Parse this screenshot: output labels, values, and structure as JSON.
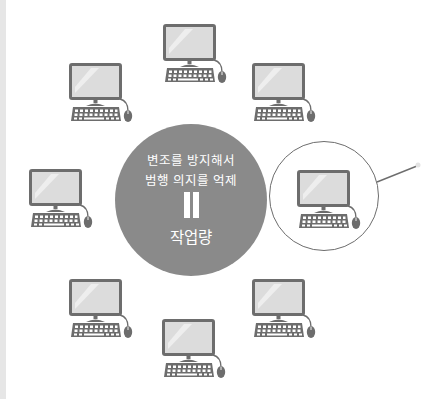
{
  "center": {
    "line1": "변조를 방지해서",
    "line2": "범행 의지를 억제",
    "equals_symbol": "‖",
    "result": "작업량"
  },
  "colors": {
    "circle_fill": "#8a8a8a",
    "icon_stroke": "#6d6d6d",
    "screen_fill": "#dcdcdc",
    "left_bar": "#e6e6e6"
  },
  "computers": [
    {
      "position": "top",
      "icon": "desktop-computer-icon"
    },
    {
      "position": "top-left",
      "icon": "desktop-computer-icon"
    },
    {
      "position": "top-right",
      "icon": "desktop-computer-icon"
    },
    {
      "position": "left",
      "icon": "desktop-computer-icon"
    },
    {
      "position": "right-highlighted",
      "icon": "desktop-computer-icon"
    },
    {
      "position": "bottom-left",
      "icon": "desktop-computer-icon"
    },
    {
      "position": "bottom-right",
      "icon": "desktop-computer-icon"
    },
    {
      "position": "bottom",
      "icon": "desktop-computer-icon"
    }
  ]
}
